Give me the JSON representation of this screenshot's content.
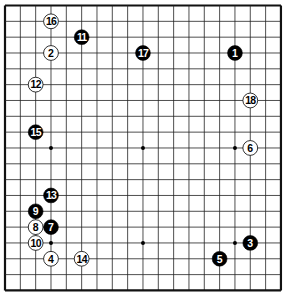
{
  "board": {
    "size": 19,
    "origin_x": 5,
    "origin_y": 5.5,
    "spacing_x": 15.33,
    "spacing_y": 15.83,
    "line_color": "#222222",
    "border_color": "#111111",
    "background": "#ffffff",
    "star_points": [
      [
        3,
        3
      ],
      [
        3,
        9
      ],
      [
        3,
        15
      ],
      [
        9,
        3
      ],
      [
        9,
        9
      ],
      [
        9,
        15
      ],
      [
        15,
        3
      ],
      [
        15,
        9
      ],
      [
        15,
        15
      ]
    ]
  },
  "stones": [
    {
      "move": "1",
      "color": "black",
      "col": 15,
      "row": 3
    },
    {
      "move": "2",
      "color": "white",
      "col": 3,
      "row": 3
    },
    {
      "move": "3",
      "color": "black",
      "col": 16,
      "row": 15
    },
    {
      "move": "4",
      "color": "white",
      "col": 3,
      "row": 16
    },
    {
      "move": "5",
      "color": "black",
      "col": 14,
      "row": 16
    },
    {
      "move": "6",
      "color": "white",
      "col": 16,
      "row": 9
    },
    {
      "move": "7",
      "color": "black",
      "col": 3,
      "row": 14
    },
    {
      "move": "8",
      "color": "white",
      "col": 2,
      "row": 14
    },
    {
      "move": "9",
      "color": "black",
      "col": 2,
      "row": 13
    },
    {
      "move": "10",
      "color": "white",
      "col": 2,
      "row": 15
    },
    {
      "move": "11",
      "color": "black",
      "col": 5,
      "row": 2
    },
    {
      "move": "12",
      "color": "white",
      "col": 2,
      "row": 5
    },
    {
      "move": "13",
      "color": "black",
      "col": 3,
      "row": 12
    },
    {
      "move": "14",
      "color": "white",
      "col": 5,
      "row": 16
    },
    {
      "move": "15",
      "color": "black",
      "col": 2,
      "row": 8
    },
    {
      "move": "16",
      "color": "white",
      "col": 3,
      "row": 1
    },
    {
      "move": "17",
      "color": "black",
      "col": 9,
      "row": 3
    },
    {
      "move": "18",
      "color": "white",
      "col": 16,
      "row": 6
    }
  ]
}
